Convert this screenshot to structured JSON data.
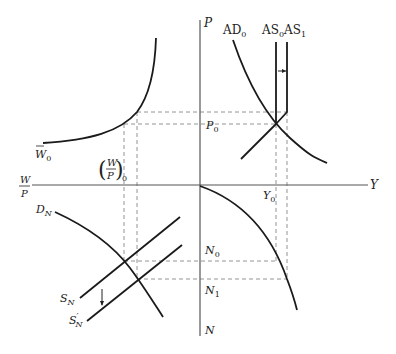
{
  "diagram": {
    "type": "four-quadrant macroeconomic model",
    "axes": {
      "price": "P",
      "output": "Y",
      "labor": "N",
      "real_wage_num": "W",
      "real_wage_den": "P"
    },
    "curves": {
      "aggregate_demand": {
        "main": "AD",
        "sub": "0"
      },
      "aggregate_supply_0": {
        "main": "AS",
        "sub": "0"
      },
      "aggregate_supply_1": {
        "main": "AS",
        "sub": "1"
      },
      "nominal_wage": {
        "main": "W",
        "sub": "0"
      },
      "labor_demand": {
        "main": "D",
        "sub": "N"
      },
      "labor_supply": {
        "main": "S",
        "sub": "N"
      },
      "labor_supply_shifted": {
        "main": "S",
        "prime": "′",
        "sub": "N"
      }
    },
    "levels": {
      "price": {
        "main": "P",
        "sub": "0"
      },
      "output": {
        "main": "Y",
        "sub": "0"
      },
      "employment_0": {
        "main": "N",
        "sub": "0"
      },
      "employment_1": {
        "main": "N",
        "sub": "1"
      },
      "real_wage": {
        "num": "W",
        "den": "P",
        "sub": "0"
      }
    }
  }
}
